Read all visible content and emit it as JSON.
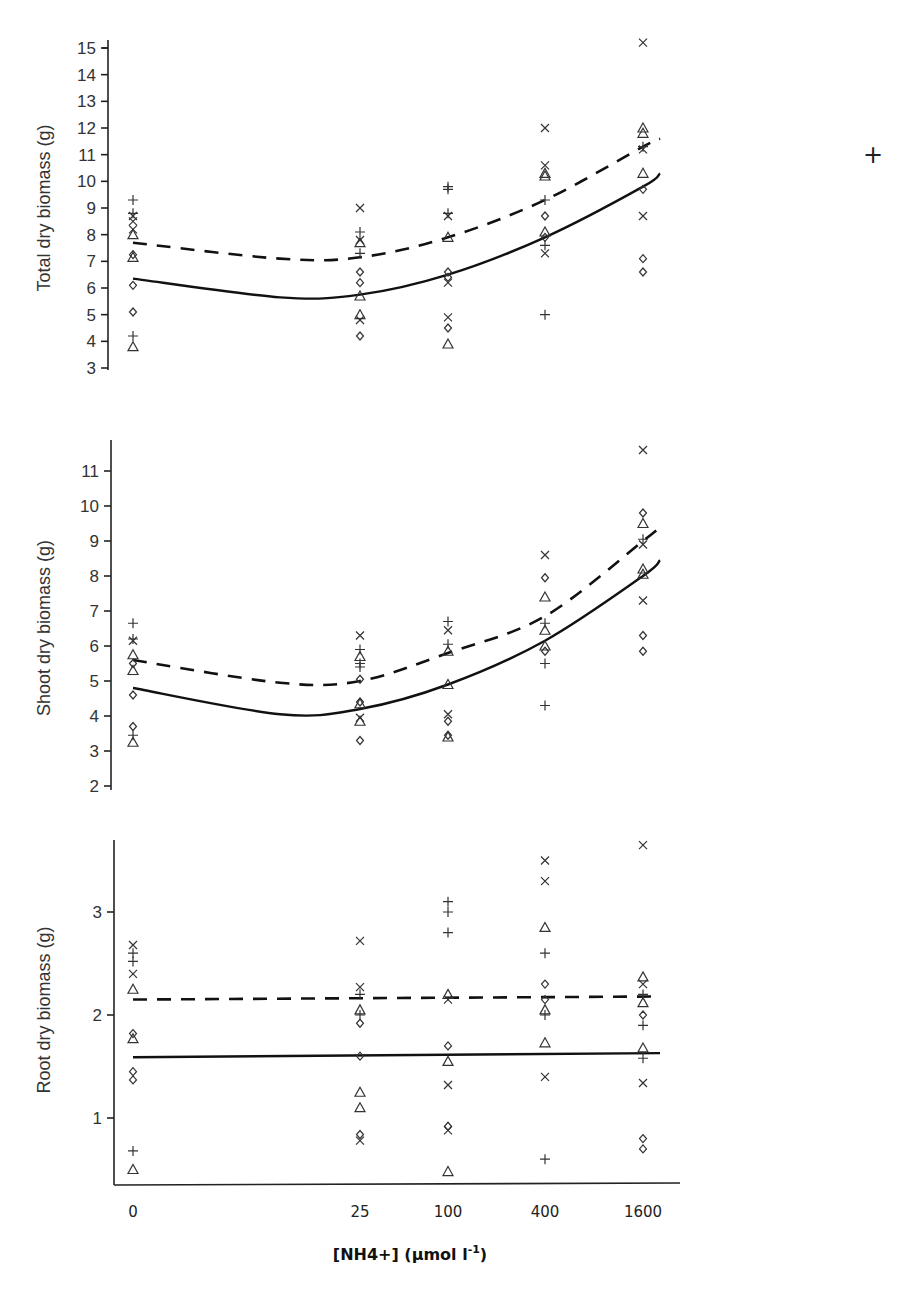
{
  "chart_data": [
    {
      "type": "scatter",
      "panel": "total",
      "title": "",
      "xlabel": "",
      "ylabel": "Total dry biomass (g)",
      "ylim": [
        3,
        15
      ],
      "yticks": [
        3,
        4,
        5,
        6,
        7,
        8,
        9,
        10,
        11,
        12,
        13,
        14,
        15
      ],
      "categories": [
        "0",
        "25",
        "100",
        "400",
        "1600"
      ],
      "grid": false,
      "markers": [
        "plus",
        "cross",
        "diamond",
        "triangle"
      ],
      "points": [
        {
          "x": "0",
          "y": 9.3,
          "m": "plus"
        },
        {
          "x": "0",
          "y": 8.8,
          "m": "plus"
        },
        {
          "x": "0",
          "y": 8.7,
          "m": "cross"
        },
        {
          "x": "0",
          "y": 8.5,
          "m": "cross"
        },
        {
          "x": "0",
          "y": 8.2,
          "m": "cross"
        },
        {
          "x": "0",
          "y": 8.0,
          "m": "triangle"
        },
        {
          "x": "0",
          "y": 7.25,
          "m": "diamond"
        },
        {
          "x": "0",
          "y": 7.15,
          "m": "triangle"
        },
        {
          "x": "0",
          "y": 6.1,
          "m": "diamond"
        },
        {
          "x": "0",
          "y": 5.1,
          "m": "diamond"
        },
        {
          "x": "0",
          "y": 4.2,
          "m": "plus"
        },
        {
          "x": "0",
          "y": 3.8,
          "m": "triangle"
        },
        {
          "x": "25",
          "y": 9.0,
          "m": "cross"
        },
        {
          "x": "25",
          "y": 8.1,
          "m": "plus"
        },
        {
          "x": "25",
          "y": 7.8,
          "m": "cross"
        },
        {
          "x": "25",
          "y": 7.7,
          "m": "triangle"
        },
        {
          "x": "25",
          "y": 7.3,
          "m": "plus"
        },
        {
          "x": "25",
          "y": 6.6,
          "m": "diamond"
        },
        {
          "x": "25",
          "y": 6.2,
          "m": "diamond"
        },
        {
          "x": "25",
          "y": 5.7,
          "m": "triangle"
        },
        {
          "x": "25",
          "y": 5.0,
          "m": "triangle"
        },
        {
          "x": "25",
          "y": 4.8,
          "m": "cross"
        },
        {
          "x": "25",
          "y": 4.2,
          "m": "diamond"
        },
        {
          "x": "100",
          "y": 9.8,
          "m": "plus"
        },
        {
          "x": "100",
          "y": 9.7,
          "m": "plus"
        },
        {
          "x": "100",
          "y": 8.8,
          "m": "plus"
        },
        {
          "x": "100",
          "y": 8.7,
          "m": "cross"
        },
        {
          "x": "100",
          "y": 7.9,
          "m": "triangle"
        },
        {
          "x": "100",
          "y": 6.6,
          "m": "diamond"
        },
        {
          "x": "100",
          "y": 6.4,
          "m": "diamond"
        },
        {
          "x": "100",
          "y": 6.2,
          "m": "cross"
        },
        {
          "x": "100",
          "y": 4.9,
          "m": "cross"
        },
        {
          "x": "100",
          "y": 4.5,
          "m": "diamond"
        },
        {
          "x": "100",
          "y": 3.9,
          "m": "triangle"
        },
        {
          "x": "400",
          "y": 12.0,
          "m": "cross"
        },
        {
          "x": "400",
          "y": 10.6,
          "m": "cross"
        },
        {
          "x": "400",
          "y": 10.3,
          "m": "triangle"
        },
        {
          "x": "400",
          "y": 10.2,
          "m": "triangle"
        },
        {
          "x": "400",
          "y": 9.3,
          "m": "plus"
        },
        {
          "x": "400",
          "y": 8.7,
          "m": "diamond"
        },
        {
          "x": "400",
          "y": 8.1,
          "m": "triangle"
        },
        {
          "x": "400",
          "y": 7.9,
          "m": "diamond"
        },
        {
          "x": "400",
          "y": 7.6,
          "m": "plus"
        },
        {
          "x": "400",
          "y": 7.3,
          "m": "cross"
        },
        {
          "x": "400",
          "y": 5.0,
          "m": "plus"
        },
        {
          "x": "1600",
          "y": 15.2,
          "m": "cross"
        },
        {
          "x": "1600",
          "y": 12.0,
          "m": "triangle"
        },
        {
          "x": "1600",
          "y": 11.8,
          "m": "triangle"
        },
        {
          "x": "1600",
          "y": 11.3,
          "m": "plus"
        },
        {
          "x": "1600",
          "y": 11.2,
          "m": "cross"
        },
        {
          "x": "1600",
          "y": 10.3,
          "m": "triangle"
        },
        {
          "x": "1600",
          "y": 9.7,
          "m": "diamond"
        },
        {
          "x": "1600",
          "y": 8.7,
          "m": "cross"
        },
        {
          "x": "1600",
          "y": 7.1,
          "m": "diamond"
        },
        {
          "x": "1600",
          "y": 6.6,
          "m": "diamond"
        }
      ],
      "series": [
        {
          "name": "fit-dashed",
          "style": "dashed",
          "x": [
            "0",
            "10",
            "25",
            "100",
            "400",
            "1600",
            "end"
          ],
          "values": [
            7.7,
            7.1,
            7.15,
            7.9,
            9.3,
            11.3,
            11.6
          ]
        },
        {
          "name": "fit-solid",
          "style": "solid",
          "x": [
            "0",
            "10",
            "25",
            "100",
            "400",
            "1600",
            "end"
          ],
          "values": [
            6.35,
            5.65,
            5.75,
            6.5,
            7.9,
            9.8,
            10.3
          ]
        }
      ]
    },
    {
      "type": "scatter",
      "panel": "shoot",
      "title": "",
      "xlabel": "",
      "ylabel": "Shoot dry biomass (g)",
      "ylim": [
        2,
        11.8
      ],
      "yticks": [
        2,
        3,
        4,
        5,
        6,
        7,
        8,
        9,
        10,
        11
      ],
      "categories": [
        "0",
        "25",
        "100",
        "400",
        "1600"
      ],
      "grid": false,
      "points": [
        {
          "x": "0",
          "y": 6.65,
          "m": "plus"
        },
        {
          "x": "0",
          "y": 6.2,
          "m": "plus"
        },
        {
          "x": "0",
          "y": 6.15,
          "m": "cross"
        },
        {
          "x": "0",
          "y": 5.75,
          "m": "triangle"
        },
        {
          "x": "0",
          "y": 5.5,
          "m": "diamond"
        },
        {
          "x": "0",
          "y": 5.3,
          "m": "triangle"
        },
        {
          "x": "0",
          "y": 4.6,
          "m": "diamond"
        },
        {
          "x": "0",
          "y": 3.7,
          "m": "diamond"
        },
        {
          "x": "0",
          "y": 3.45,
          "m": "plus"
        },
        {
          "x": "0",
          "y": 3.25,
          "m": "triangle"
        },
        {
          "x": "25",
          "y": 6.3,
          "m": "cross"
        },
        {
          "x": "25",
          "y": 5.9,
          "m": "plus"
        },
        {
          "x": "25",
          "y": 5.7,
          "m": "triangle"
        },
        {
          "x": "25",
          "y": 5.5,
          "m": "plus"
        },
        {
          "x": "25",
          "y": 5.4,
          "m": "plus"
        },
        {
          "x": "25",
          "y": 5.05,
          "m": "diamond"
        },
        {
          "x": "25",
          "y": 4.4,
          "m": "diamond"
        },
        {
          "x": "25",
          "y": 4.35,
          "m": "triangle"
        },
        {
          "x": "25",
          "y": 3.95,
          "m": "cross"
        },
        {
          "x": "25",
          "y": 3.85,
          "m": "triangle"
        },
        {
          "x": "25",
          "y": 3.3,
          "m": "diamond"
        },
        {
          "x": "100",
          "y": 6.7,
          "m": "plus"
        },
        {
          "x": "100",
          "y": 6.45,
          "m": "cross"
        },
        {
          "x": "100",
          "y": 6.05,
          "m": "plus"
        },
        {
          "x": "100",
          "y": 5.85,
          "m": "triangle"
        },
        {
          "x": "100",
          "y": 4.9,
          "m": "triangle"
        },
        {
          "x": "100",
          "y": 4.05,
          "m": "cross"
        },
        {
          "x": "100",
          "y": 3.85,
          "m": "diamond"
        },
        {
          "x": "100",
          "y": 3.45,
          "m": "diamond"
        },
        {
          "x": "100",
          "y": 3.4,
          "m": "triangle"
        },
        {
          "x": "400",
          "y": 8.6,
          "m": "cross"
        },
        {
          "x": "400",
          "y": 7.95,
          "m": "diamond"
        },
        {
          "x": "400",
          "y": 7.4,
          "m": "triangle"
        },
        {
          "x": "400",
          "y": 6.65,
          "m": "plus"
        },
        {
          "x": "400",
          "y": 6.45,
          "m": "triangle"
        },
        {
          "x": "400",
          "y": 6.0,
          "m": "triangle"
        },
        {
          "x": "400",
          "y": 5.85,
          "m": "diamond"
        },
        {
          "x": "400",
          "y": 5.5,
          "m": "plus"
        },
        {
          "x": "400",
          "y": 4.3,
          "m": "plus"
        },
        {
          "x": "1600",
          "y": 11.6,
          "m": "cross"
        },
        {
          "x": "1600",
          "y": 9.8,
          "m": "diamond"
        },
        {
          "x": "1600",
          "y": 9.5,
          "m": "triangle"
        },
        {
          "x": "1600",
          "y": 9.05,
          "m": "plus"
        },
        {
          "x": "1600",
          "y": 8.9,
          "m": "cross"
        },
        {
          "x": "1600",
          "y": 8.2,
          "m": "triangle"
        },
        {
          "x": "1600",
          "y": 8.05,
          "m": "triangle"
        },
        {
          "x": "1600",
          "y": 7.3,
          "m": "cross"
        },
        {
          "x": "1600",
          "y": 6.3,
          "m": "diamond"
        },
        {
          "x": "1600",
          "y": 5.85,
          "m": "diamond"
        }
      ],
      "series": [
        {
          "name": "fit-dashed",
          "style": "dashed",
          "x": [
            "0",
            "10",
            "25",
            "100",
            "400",
            "1600",
            "end"
          ],
          "values": [
            5.6,
            4.95,
            5.0,
            5.8,
            6.85,
            9.0,
            9.4
          ]
        },
        {
          "name": "fit-solid",
          "style": "solid",
          "x": [
            "0",
            "10",
            "25",
            "100",
            "400",
            "1600",
            "end"
          ],
          "values": [
            4.8,
            4.05,
            4.2,
            4.9,
            6.15,
            8.0,
            8.45
          ]
        }
      ]
    },
    {
      "type": "scatter",
      "panel": "root",
      "title": "",
      "xlabel": "[NH4+] (µmol l⁻¹)",
      "ylabel": "Root dry biomass (g)",
      "ylim": [
        0.3,
        3.7
      ],
      "yticks": [
        1,
        2,
        3
      ],
      "categories": [
        "0",
        "25",
        "100",
        "400",
        "1600"
      ],
      "grid": false,
      "points": [
        {
          "x": "0",
          "y": 2.68,
          "m": "cross"
        },
        {
          "x": "0",
          "y": 2.6,
          "m": "plus"
        },
        {
          "x": "0",
          "y": 2.52,
          "m": "plus"
        },
        {
          "x": "0",
          "y": 2.4,
          "m": "cross"
        },
        {
          "x": "0",
          "y": 2.25,
          "m": "triangle"
        },
        {
          "x": "0",
          "y": 1.82,
          "m": "diamond"
        },
        {
          "x": "0",
          "y": 1.77,
          "m": "triangle"
        },
        {
          "x": "0",
          "y": 1.45,
          "m": "diamond"
        },
        {
          "x": "0",
          "y": 1.37,
          "m": "diamond"
        },
        {
          "x": "0",
          "y": 0.68,
          "m": "plus"
        },
        {
          "x": "0",
          "y": 0.5,
          "m": "triangle"
        },
        {
          "x": "25",
          "y": 2.72,
          "m": "cross"
        },
        {
          "x": "25",
          "y": 2.27,
          "m": "cross"
        },
        {
          "x": "25",
          "y": 2.2,
          "m": "plus"
        },
        {
          "x": "25",
          "y": 2.05,
          "m": "triangle"
        },
        {
          "x": "25",
          "y": 2.0,
          "m": "plus"
        },
        {
          "x": "25",
          "y": 1.92,
          "m": "diamond"
        },
        {
          "x": "25",
          "y": 1.6,
          "m": "diamond"
        },
        {
          "x": "25",
          "y": 1.25,
          "m": "triangle"
        },
        {
          "x": "25",
          "y": 1.1,
          "m": "triangle"
        },
        {
          "x": "25",
          "y": 0.84,
          "m": "diamond"
        },
        {
          "x": "25",
          "y": 0.78,
          "m": "cross"
        },
        {
          "x": "100",
          "y": 3.1,
          "m": "plus"
        },
        {
          "x": "100",
          "y": 3.0,
          "m": "plus"
        },
        {
          "x": "100",
          "y": 2.8,
          "m": "plus"
        },
        {
          "x": "100",
          "y": 2.2,
          "m": "triangle"
        },
        {
          "x": "100",
          "y": 2.15,
          "m": "cross"
        },
        {
          "x": "100",
          "y": 1.7,
          "m": "diamond"
        },
        {
          "x": "100",
          "y": 1.55,
          "m": "triangle"
        },
        {
          "x": "100",
          "y": 1.32,
          "m": "cross"
        },
        {
          "x": "100",
          "y": 0.92,
          "m": "diamond"
        },
        {
          "x": "100",
          "y": 0.88,
          "m": "cross"
        },
        {
          "x": "100",
          "y": 0.48,
          "m": "triangle"
        },
        {
          "x": "400",
          "y": 3.5,
          "m": "cross"
        },
        {
          "x": "400",
          "y": 3.3,
          "m": "cross"
        },
        {
          "x": "400",
          "y": 2.85,
          "m": "triangle"
        },
        {
          "x": "400",
          "y": 2.6,
          "m": "plus"
        },
        {
          "x": "400",
          "y": 2.3,
          "m": "diamond"
        },
        {
          "x": "400",
          "y": 2.15,
          "m": "diamond"
        },
        {
          "x": "400",
          "y": 2.05,
          "m": "triangle"
        },
        {
          "x": "400",
          "y": 2.0,
          "m": "plus"
        },
        {
          "x": "400",
          "y": 1.73,
          "m": "triangle"
        },
        {
          "x": "400",
          "y": 1.4,
          "m": "cross"
        },
        {
          "x": "400",
          "y": 0.6,
          "m": "plus"
        },
        {
          "x": "1600",
          "y": 3.65,
          "m": "cross"
        },
        {
          "x": "1600",
          "y": 2.37,
          "m": "triangle"
        },
        {
          "x": "1600",
          "y": 2.3,
          "m": "cross"
        },
        {
          "x": "1600",
          "y": 2.2,
          "m": "plus"
        },
        {
          "x": "1600",
          "y": 2.12,
          "m": "triangle"
        },
        {
          "x": "1600",
          "y": 2.0,
          "m": "diamond"
        },
        {
          "x": "1600",
          "y": 1.9,
          "m": "plus"
        },
        {
          "x": "1600",
          "y": 1.68,
          "m": "triangle"
        },
        {
          "x": "1600",
          "y": 1.58,
          "m": "plus"
        },
        {
          "x": "1600",
          "y": 1.34,
          "m": "cross"
        },
        {
          "x": "1600",
          "y": 0.8,
          "m": "diamond"
        },
        {
          "x": "1600",
          "y": 0.7,
          "m": "diamond"
        }
      ],
      "series": [
        {
          "name": "fit-dashed",
          "style": "dashed",
          "x": [
            "0",
            "end"
          ],
          "values": [
            2.15,
            2.18
          ]
        },
        {
          "name": "fit-solid",
          "style": "solid",
          "x": [
            "0",
            "end"
          ],
          "values": [
            1.59,
            1.63
          ]
        }
      ]
    }
  ],
  "labels": {
    "total_ylabel": "Total dry biomass (g)",
    "shoot_ylabel": "Shoot dry biomass (g)",
    "root_ylabel": "Root dry biomass (g)",
    "xlabel": "[NH4+] (µmol l",
    "xlabel_sup": "-1",
    "xlabel_close": ")",
    "x_ticks": [
      "0",
      "25",
      "100",
      "400",
      "1600"
    ]
  },
  "stray_mark": "+"
}
